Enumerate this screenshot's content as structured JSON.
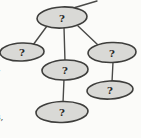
{
  "diagram": {
    "type": "tree-graph",
    "nodes": [
      {
        "id": "root",
        "label": "?"
      },
      {
        "id": "left-child",
        "label": "?"
      },
      {
        "id": "right-child",
        "label": "?"
      },
      {
        "id": "middle-child",
        "label": "?"
      },
      {
        "id": "right-grandchild",
        "label": "?"
      },
      {
        "id": "middle-grandchild",
        "label": "?"
      }
    ],
    "edges": [
      {
        "from": "root",
        "to": "offscreen-top-right"
      },
      {
        "from": "root",
        "to": "left-child"
      },
      {
        "from": "root",
        "to": "middle-child"
      },
      {
        "from": "root",
        "to": "right-child"
      },
      {
        "from": "middle-child",
        "to": "middle-grandchild"
      },
      {
        "from": "right-child",
        "to": "right-grandchild"
      }
    ],
    "colors": {
      "node_fill": "#d9d9d6",
      "node_stroke": "#3e3e3c",
      "edge": "#4a4a48",
      "label": "#262624",
      "background": "#fbfbf9"
    }
  },
  "margin_fragments": [
    {
      "text": "”"
    },
    {
      "text": ","
    },
    {
      "text": "s,"
    }
  ]
}
